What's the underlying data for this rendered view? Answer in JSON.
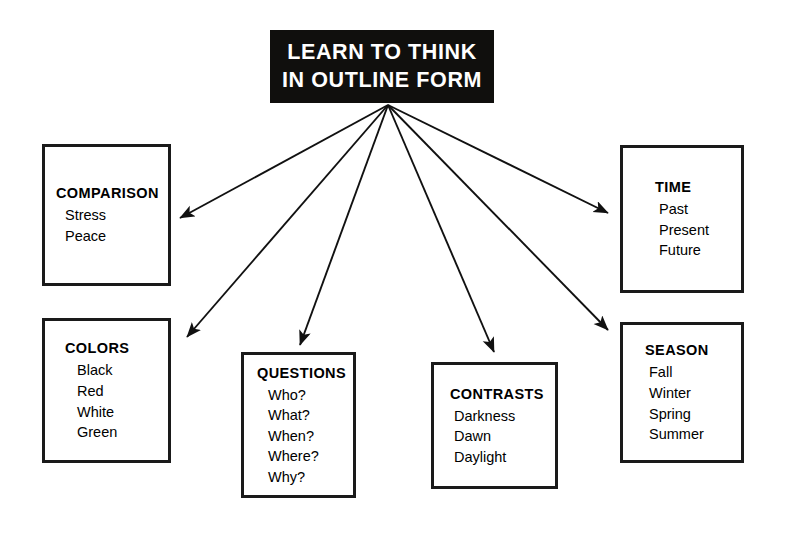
{
  "title": {
    "line1": "LEARN TO THINK",
    "line2": "IN OUTLINE FORM",
    "background_color": "#100f0d",
    "text_color": "#ffffff"
  },
  "colors": {
    "page_background": "#ffffff",
    "ink": "#1a1a1a",
    "arrow": "#111111"
  },
  "categories": [
    {
      "id": "comparison",
      "title": "COMPARISON",
      "items": [
        "Stress",
        "Peace"
      ]
    },
    {
      "id": "colors",
      "title": "COLORS",
      "items": [
        "Black",
        "Red",
        "White",
        "Green"
      ]
    },
    {
      "id": "questions",
      "title": "QUESTIONS",
      "items": [
        "Who?",
        "What?",
        "When?",
        "Where?",
        "Why?"
      ]
    },
    {
      "id": "contrasts",
      "title": "CONTRASTS",
      "items": [
        "Darkness",
        "Dawn",
        "Daylight"
      ]
    },
    {
      "id": "time",
      "title": "TIME",
      "items": [
        "Past",
        "Present",
        "Future"
      ]
    },
    {
      "id": "season",
      "title": "SEASON",
      "items": [
        "Fall",
        "Winter",
        "Spring",
        "Summer"
      ]
    }
  ],
  "connectors": {
    "origin": {
      "x": 388,
      "y": 105
    },
    "arrows": [
      {
        "target": "comparison",
        "x": 180,
        "y": 218
      },
      {
        "target": "colors",
        "x": 187,
        "y": 337
      },
      {
        "target": "questions",
        "x": 300,
        "y": 345
      },
      {
        "target": "contrasts",
        "x": 494,
        "y": 352
      },
      {
        "target": "season",
        "x": 608,
        "y": 330
      },
      {
        "target": "time",
        "x": 608,
        "y": 213
      }
    ]
  }
}
